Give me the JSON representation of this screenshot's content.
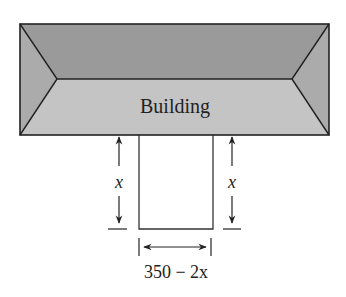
{
  "diagram": {
    "building_label": "Building",
    "left_dimension_label": "x",
    "right_dimension_label": "x",
    "bottom_dimension_label": "350 − 2x",
    "colors": {
      "roof_top": "#9a9a9a",
      "roof_bottom": "#c4c4c4",
      "roof_sides": "#ababab",
      "line": "#222222"
    }
  }
}
